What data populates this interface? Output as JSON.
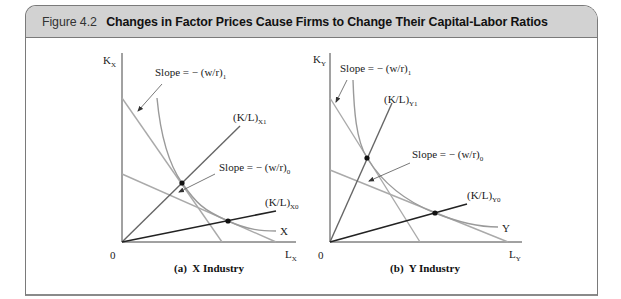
{
  "figure": {
    "number": "Figure 4.2",
    "title": "Changes in Factor Prices Cause Firms to Change Their Capital-Labor Ratios"
  },
  "panels": [
    {
      "caption": "(a)  X Industry",
      "y_axis": {
        "main": "K",
        "sub": "X"
      },
      "x_axis": {
        "main": "L",
        "sub": "X"
      },
      "origin": "0",
      "slope_1": {
        "main": "Slope = − (w/r)",
        "sub": "1"
      },
      "slope_0": {
        "main": "Slope = − (w/r)",
        "sub": "0"
      },
      "ray_1": {
        "main": "(K/L)",
        "sub": "X1"
      },
      "ray_0": {
        "main": "(K/L)",
        "sub": "X0"
      },
      "isoquant": "X"
    },
    {
      "caption": "(b)  Y Industry",
      "y_axis": {
        "main": "K",
        "sub": "Y"
      },
      "x_axis": {
        "main": "L",
        "sub": "Y"
      },
      "origin": "0",
      "slope_1": {
        "main": "Slope = − (w/r)",
        "sub": "1"
      },
      "slope_0": {
        "main": "Slope = − (w/r)",
        "sub": "0"
      },
      "ray_1": {
        "main": "(K/L)",
        "sub": "Y1"
      },
      "ray_0": {
        "main": "(K/L)",
        "sub": "Y0"
      },
      "isoquant": "Y"
    }
  ],
  "colors": {
    "header_bg": "#d2d2d2",
    "border": "#7a7a7a",
    "budget_line": "#aaaaaa",
    "isoquant": "#9a9a9a",
    "ray_steep": "#666666",
    "ray_flat": "#222222",
    "axis": "#444444"
  }
}
